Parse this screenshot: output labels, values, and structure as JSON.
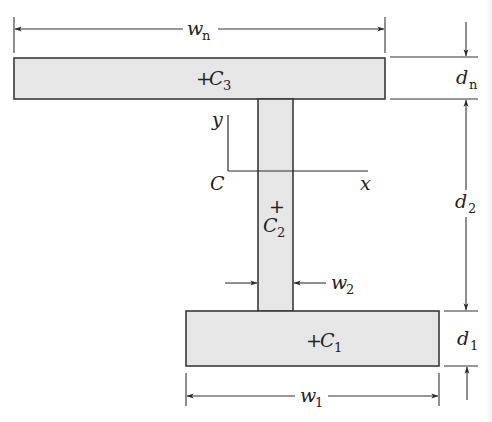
{
  "diagram": {
    "shapes": {
      "top_flange": {
        "centroid_label": "C",
        "centroid_sub": "3",
        "marker": "+"
      },
      "web": {
        "centroid_label": "C",
        "centroid_sub": "2",
        "marker": "+"
      },
      "bottom_flange": {
        "centroid_label": "C",
        "centroid_sub": "1",
        "marker": "+"
      }
    },
    "axes": {
      "origin_label": "C",
      "x_label": "x",
      "y_label": "y"
    },
    "dimensions": {
      "wn": {
        "base": "w",
        "sub": "n"
      },
      "dn": {
        "base": "d",
        "sub": "n"
      },
      "d2": {
        "base": "d",
        "sub": "2"
      },
      "w2": {
        "base": "w",
        "sub": "2"
      },
      "d1": {
        "base": "d",
        "sub": "1"
      },
      "w1": {
        "base": "w",
        "sub": "1"
      }
    },
    "colors": {
      "plate_fill": "#e6e6e6",
      "stroke": "#333333",
      "background": "#ffffff"
    }
  }
}
